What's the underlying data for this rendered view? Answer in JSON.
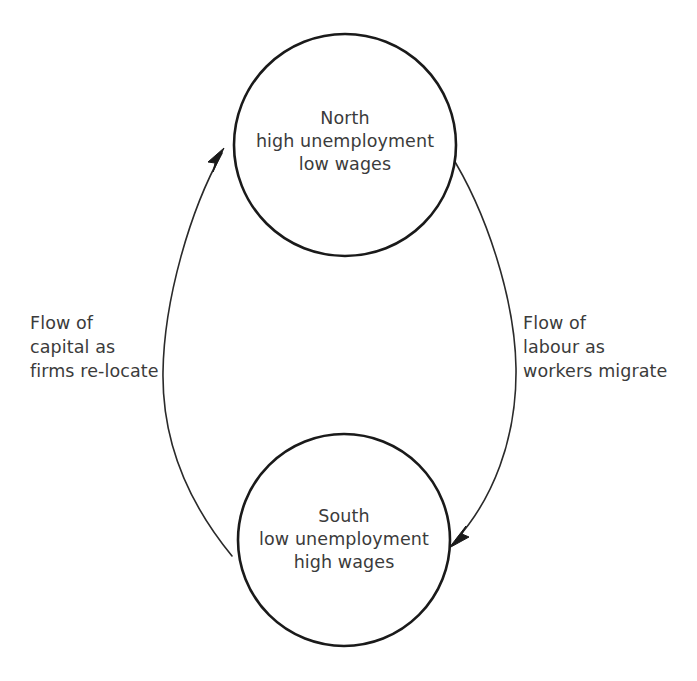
{
  "diagram": {
    "background_color": "#ffffff",
    "stroke_color": "#1a1a1a",
    "text_color": "#3b3b3b",
    "nodes": [
      {
        "id": "north",
        "shape": "circle",
        "lines": [
          "North",
          "high unemployment",
          "low wages"
        ],
        "line1": "North",
        "line2": "high unemployment",
        "line3": "low wages",
        "cx": 345,
        "cy": 145,
        "r": 111
      },
      {
        "id": "south",
        "shape": "circle",
        "lines": [
          "South",
          "low unemployment",
          "high wages"
        ],
        "line1": "South",
        "line2": "low unemployment",
        "line3": "high wages",
        "cx": 344,
        "cy": 540,
        "r": 106
      }
    ],
    "edges": [
      {
        "id": "capital-flow",
        "from": "south",
        "to": "north",
        "direction": "south-to-north",
        "side": "left",
        "lines": [
          "Flow of",
          "capital as",
          "firms re-locate"
        ],
        "line1": "Flow of",
        "line2": "capital as",
        "line3": "firms re-locate"
      },
      {
        "id": "labour-flow",
        "from": "north",
        "to": "south",
        "direction": "north-to-south",
        "side": "right",
        "lines": [
          "Flow of",
          "labour as",
          "workers migrate"
        ],
        "line1": "Flow of",
        "line2": "labour as",
        "line3": "workers migrate"
      }
    ]
  }
}
